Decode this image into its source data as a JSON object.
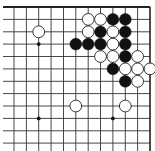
{
  "game": {
    "type": "go",
    "view": "top-right corner fragment",
    "board_size": 19,
    "visible_columns": 12,
    "visible_rows": 12,
    "edges": {
      "top": true,
      "right": true,
      "left": false,
      "bottom": false
    },
    "grid": {
      "x_lines": [
        14,
        26.4,
        38.7,
        51.1,
        63.5,
        75.8,
        88.2,
        100.5,
        112.9,
        125.3,
        137.6,
        150
      ],
      "y_lines": [
        7,
        19.4,
        31.8,
        44.1,
        56.5,
        68.9,
        81.3,
        93.6,
        106,
        118.4,
        130.8,
        143.1
      ],
      "line_color": "#333333",
      "edge_color": "#222222",
      "background": "#ffffff"
    },
    "star_points": [
      {
        "col": 2,
        "row": 3
      },
      {
        "col": 8,
        "row": 3
      },
      {
        "col": 2,
        "row": 9
      },
      {
        "col": 8,
        "row": 9
      }
    ],
    "stones": [
      {
        "color": "white",
        "col": 6,
        "row": 1
      },
      {
        "color": "white",
        "col": 7,
        "row": 1
      },
      {
        "color": "black",
        "col": 8,
        "row": 1
      },
      {
        "color": "black",
        "col": 9,
        "row": 1
      },
      {
        "color": "white",
        "col": 2,
        "row": 2
      },
      {
        "color": "white",
        "col": 6,
        "row": 2
      },
      {
        "color": "black",
        "col": 7,
        "row": 2
      },
      {
        "color": "white",
        "col": 8,
        "row": 2
      },
      {
        "color": "black",
        "col": 9,
        "row": 2
      },
      {
        "color": "black",
        "col": 5,
        "row": 3
      },
      {
        "color": "black",
        "col": 6,
        "row": 3
      },
      {
        "color": "black",
        "col": 7,
        "row": 3
      },
      {
        "color": "white",
        "col": 8,
        "row": 3
      },
      {
        "color": "black",
        "col": 9,
        "row": 3
      },
      {
        "color": "white",
        "col": 7,
        "row": 4
      },
      {
        "color": "white",
        "col": 8,
        "row": 4
      },
      {
        "color": "black",
        "col": 9,
        "row": 4
      },
      {
        "color": "white",
        "col": 10,
        "row": 4
      },
      {
        "color": "black",
        "col": 8,
        "row": 5
      },
      {
        "color": "white",
        "col": 9,
        "row": 5
      },
      {
        "color": "white",
        "col": 10,
        "row": 5
      },
      {
        "color": "white",
        "col": 11,
        "row": 5
      },
      {
        "color": "black",
        "col": 9,
        "row": 6
      },
      {
        "color": "white",
        "col": 10,
        "row": 6
      },
      {
        "color": "white",
        "col": 5,
        "row": 8
      },
      {
        "color": "white",
        "col": 9,
        "row": 8
      }
    ],
    "colors": {
      "black_stone": "#111111",
      "white_stone_fill": "#ffffff",
      "white_stone_stroke": "#222222"
    }
  }
}
